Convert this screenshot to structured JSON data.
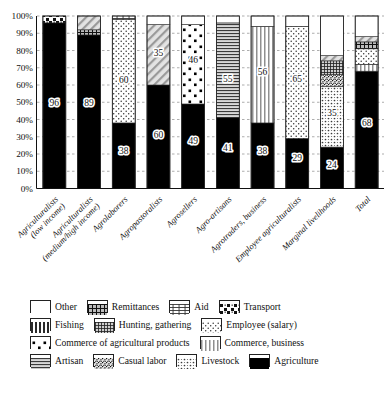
{
  "chart_data": {
    "type": "bar",
    "title": "",
    "xlabel": "",
    "ylabel": "",
    "ylim": [
      0,
      100
    ],
    "stacked": true,
    "grid": true,
    "legend_position": "bottom",
    "ytick_labels": [
      "0%",
      "10%",
      "20%",
      "30%",
      "40%",
      "50%",
      "60%",
      "70%",
      "80%",
      "90%",
      "100%"
    ],
    "ytick_values": [
      0,
      10,
      20,
      30,
      40,
      50,
      60,
      70,
      80,
      90,
      100
    ],
    "categories": [
      "Agriculturalists (low income)",
      "Agriculturalists (medium/high income)",
      "Agrolaborers",
      "Agropastoralists",
      "Agrosellers",
      "Agro-artisans",
      "Agrotraders, business",
      "Employee agriculturalists",
      "Marginal livelihoods",
      "Total"
    ],
    "series": [
      {
        "name": "Agriculture",
        "pattern": "solid-black",
        "values": [
          96,
          89,
          38,
          60,
          49,
          41,
          38,
          29,
          24,
          68
        ]
      },
      {
        "name": "Livestock",
        "pattern": "gray-solid",
        "values": [
          0,
          0,
          0,
          0,
          0,
          0,
          0,
          0,
          35,
          0
        ]
      },
      {
        "name": "Casual labor",
        "pattern": "noise",
        "values": [
          0,
          0,
          0,
          0,
          0,
          0,
          0,
          0,
          7,
          0
        ]
      },
      {
        "name": "Artisan",
        "pattern": "h-lines",
        "values": [
          0,
          0,
          0,
          0,
          0,
          55,
          0,
          0,
          0,
          0
        ]
      },
      {
        "name": "Commerce, business",
        "pattern": "v-lines",
        "values": [
          0,
          0,
          0,
          0,
          0,
          0,
          56,
          0,
          0,
          4
        ]
      },
      {
        "name": "Commerce of agricultural products",
        "pattern": "sq-dots",
        "values": [
          0,
          0,
          0,
          0,
          46,
          0,
          0,
          0,
          0,
          0
        ]
      },
      {
        "name": "Employee (salary)",
        "pattern": "fine-dots",
        "values": [
          0,
          0,
          60,
          0,
          0,
          0,
          0,
          65,
          0,
          9
        ]
      },
      {
        "name": "Hunting, gathering",
        "pattern": "grid-fine",
        "values": [
          0,
          0,
          0,
          0,
          0,
          0,
          0,
          0,
          8,
          0
        ]
      },
      {
        "name": "Fishing",
        "pattern": "v-lines-bold",
        "values": [
          0,
          0,
          0,
          0,
          0,
          0,
          0,
          0,
          0,
          0
        ]
      },
      {
        "name": "Transport",
        "pattern": "transport",
        "values": [
          4,
          0,
          0,
          0,
          0,
          0,
          0,
          0,
          0,
          0
        ]
      },
      {
        "name": "Aid",
        "pattern": "aid",
        "values": [
          0,
          0,
          2,
          0,
          0,
          0,
          0,
          0,
          0,
          0
        ]
      },
      {
        "name": "Remittances",
        "pattern": "remit",
        "values": [
          0,
          3,
          0,
          0,
          0,
          0,
          0,
          0,
          0,
          4
        ]
      },
      {
        "name": "Casual labor (thin)",
        "pattern": "hatch",
        "values": [
          0,
          8,
          0,
          35,
          0,
          0,
          0,
          0,
          3,
          3
        ]
      },
      {
        "name": "Other",
        "pattern": "white",
        "values": [
          0,
          0,
          0,
          5,
          5,
          4,
          6,
          6,
          23,
          12
        ]
      }
    ],
    "value_labels": [
      {
        "bar": 0,
        "text": "96",
        "at": 50
      },
      {
        "bar": 1,
        "text": "89",
        "at": 50
      },
      {
        "bar": 2,
        "text": "38",
        "at": 22
      },
      {
        "bar": 2,
        "text": "60",
        "at": 63
      },
      {
        "bar": 3,
        "text": "60",
        "at": 31
      },
      {
        "bar": 3,
        "text": "35",
        "at": 79
      },
      {
        "bar": 4,
        "text": "49",
        "at": 28
      },
      {
        "bar": 4,
        "text": "46",
        "at": 75
      },
      {
        "bar": 5,
        "text": "41",
        "at": 24
      },
      {
        "bar": 5,
        "text": "55",
        "at": 64
      },
      {
        "bar": 6,
        "text": "38",
        "at": 22
      },
      {
        "bar": 6,
        "text": "56",
        "at": 68
      },
      {
        "bar": 7,
        "text": "29",
        "at": 18
      },
      {
        "bar": 7,
        "text": "65",
        "at": 64
      },
      {
        "bar": 8,
        "text": "24",
        "at": 14
      },
      {
        "bar": 8,
        "text": "35",
        "at": 44
      },
      {
        "bar": 9,
        "text": "68",
        "at": 38
      }
    ]
  },
  "legend": {
    "rows": [
      [
        {
          "label": "Other",
          "pattern": "white"
        },
        {
          "label": "Remittances",
          "pattern": "remit"
        },
        {
          "label": "Aid",
          "pattern": "aid"
        },
        {
          "label": "Transport",
          "pattern": "transport"
        }
      ],
      [
        {
          "label": "Fishing",
          "pattern": "v-lines-bold"
        },
        {
          "label": "Hunting, gathering",
          "pattern": "grid-fine"
        },
        {
          "label": "Employee (salary)",
          "pattern": "fine-dots"
        }
      ],
      [
        {
          "label": "Commerce of agricultural products",
          "pattern": "sq-dots"
        },
        {
          "label": "Commerce, business",
          "pattern": "v-lines"
        }
      ],
      [
        {
          "label": "Artisan",
          "pattern": "h-lines"
        },
        {
          "label": "Casual labor",
          "pattern": "noise"
        },
        {
          "label": "Livestock",
          "pattern": "gray-solid"
        },
        {
          "label": "Agriculture",
          "pattern": "solid-black"
        }
      ]
    ]
  }
}
